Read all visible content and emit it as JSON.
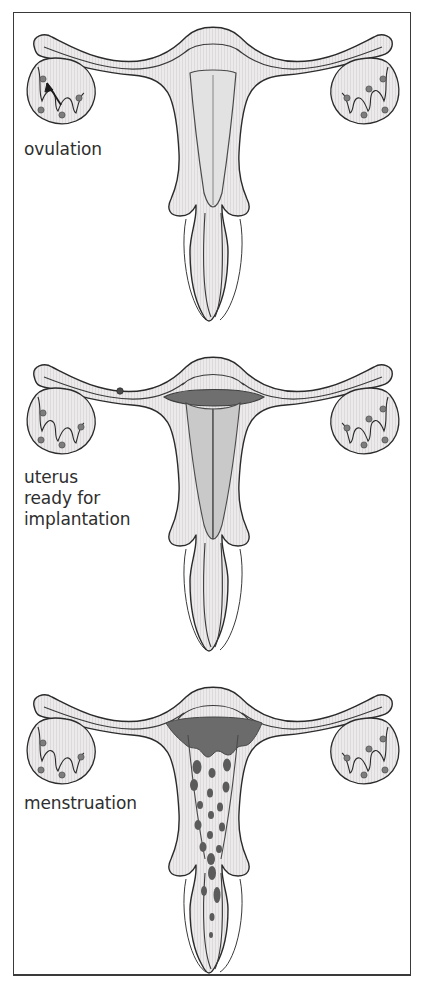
{
  "figure": {
    "background_color": "#ffffff",
    "frame_color": "#3a3a3a"
  },
  "style": {
    "organ_fill": "#e9e9e9",
    "organ_fill_light": "#f1f1f1",
    "outline_color": "#2b2b2b",
    "endometrium_dark": "#6b6b6b",
    "blood_color": "#5b5b5b",
    "follicle_color": "#7d7d7d",
    "ovum_color": "#4a4a4a",
    "label_color": "#2e2e2e",
    "hatch_color": "#d7d7d7"
  },
  "panels": [
    {
      "id": "ovulation",
      "label": "ovulation",
      "caption_lines": [
        "ovulation"
      ],
      "endometrium_state": "thin",
      "has_ovulation_arrow": true,
      "has_ovum_in_tube": false,
      "has_menstrual_flow": false,
      "left_ovary_follicles": 4,
      "right_ovary_follicles": 5
    },
    {
      "id": "implantation",
      "label": "uterus\nready for\nimplantation",
      "caption_lines": [
        "uterus",
        "ready for",
        "implantation"
      ],
      "endometrium_state": "thickened",
      "has_ovulation_arrow": false,
      "has_ovum_in_tube": true,
      "has_menstrual_flow": false,
      "left_ovary_follicles": 4,
      "right_ovary_follicles": 5
    },
    {
      "id": "menstruation",
      "label": "menstruation",
      "caption_lines": [
        "menstruation"
      ],
      "endometrium_state": "shedding",
      "has_ovulation_arrow": false,
      "has_ovum_in_tube": false,
      "has_menstrual_flow": true,
      "left_ovary_follicles": 4,
      "right_ovary_follicles": 5
    }
  ],
  "anatomy_parts": [
    "fallopian-tube-left",
    "fallopian-tube-right",
    "ovary-left",
    "ovary-right",
    "uterus-fundus",
    "uterine-cavity",
    "endometrium",
    "cervix",
    "vagina"
  ]
}
